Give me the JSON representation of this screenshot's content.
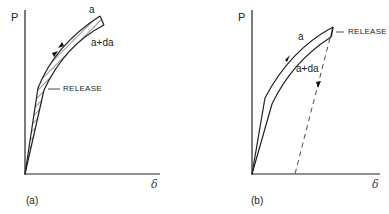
{
  "panels": [
    {
      "id": "a",
      "caption": "(a)",
      "y_axis_label": "P",
      "x_axis_label": "δ",
      "curve_upper_label": "a",
      "curve_lower_label": "a+da",
      "annotation": "RELEASE"
    },
    {
      "id": "b",
      "caption": "(b)",
      "y_axis_label": "P",
      "x_axis_label": "δ",
      "curve_upper_label": "a",
      "curve_lower_label": "a+da",
      "annotation": "RELEASE"
    }
  ]
}
